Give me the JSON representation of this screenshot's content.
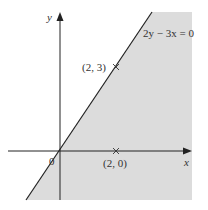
{
  "figure": {
    "type": "inequality-region-graph",
    "axes": {
      "x_label": "x",
      "y_label": "y",
      "origin_label": "0"
    },
    "line": {
      "equation": "2y − 3x = 0"
    },
    "points": [
      {
        "label": "(2, 3)",
        "x": 2,
        "y": 3,
        "marker": "cross"
      },
      {
        "label": "(2, 0)",
        "x": 2,
        "y": 0,
        "marker": "cross"
      }
    ],
    "shaded_region": "right of / below the line 2y − 3x = 0",
    "colors": {
      "shade": "#dcdcdc",
      "line": "#222222",
      "axis": "#222222",
      "text": "#333333"
    }
  }
}
